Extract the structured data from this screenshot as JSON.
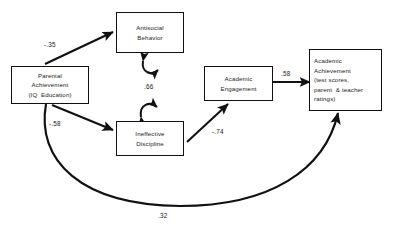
{
  "diagram": {
    "type": "path-diagram",
    "title": "",
    "background_color": "#ffffff",
    "line_color": "#111111",
    "text_color": "#1a1a1a",
    "nodes": [
      {
        "id": "parental-achievement",
        "lines": [
          "Parental",
          "Achievement",
          "(IQ  Education)"
        ]
      },
      {
        "id": "antisocial-behavior",
        "lines": [
          "Antisocial",
          "Behavior"
        ]
      },
      {
        "id": "ineffective-discipline",
        "lines": [
          "Ineffective",
          "Discipline"
        ]
      },
      {
        "id": "academic-engagement",
        "lines": [
          "Academic",
          "Engagement"
        ]
      },
      {
        "id": "academic-achievement",
        "lines": [
          "Academic",
          "Achievement",
          "(test scores,",
          "parent  & teacher",
          "ratings)"
        ]
      }
    ],
    "paths": [
      {
        "id": "parental-to-antisocial",
        "from": "parental-achievement",
        "to": "antisocial-behavior",
        "coefficient": "-.35",
        "style": "straight-arrow"
      },
      {
        "id": "parental-to-discipline",
        "from": "parental-achievement",
        "to": "ineffective-discipline",
        "coefficient": "-.58",
        "style": "straight-arrow"
      },
      {
        "id": "antisocial-discipline-correlation",
        "from": "antisocial-behavior",
        "to": "ineffective-discipline",
        "coefficient": ".66",
        "style": "curved-double-arrow"
      },
      {
        "id": "discipline-to-engagement",
        "from": "ineffective-discipline",
        "to": "academic-engagement",
        "coefficient": "-.74",
        "style": "straight-arrow"
      },
      {
        "id": "engagement-to-achievement",
        "from": "academic-engagement",
        "to": "academic-achievement",
        "coefficient": ".58",
        "style": "straight-arrow"
      },
      {
        "id": "parental-to-achievement",
        "from": "parental-achievement",
        "to": "academic-achievement",
        "coefficient": ".32",
        "style": "long-curved-arrow"
      }
    ]
  }
}
